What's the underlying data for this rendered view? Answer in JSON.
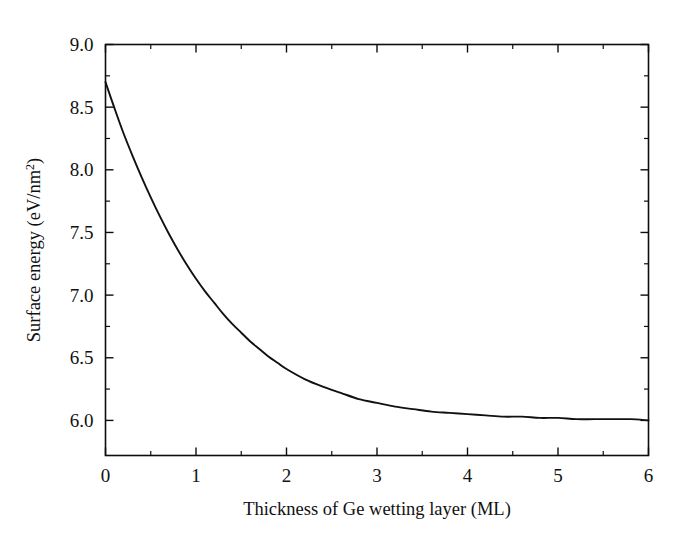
{
  "figure": {
    "background_color": "#ffffff",
    "line_color": "#111111",
    "axis_color": "#0d0d0d"
  },
  "chart_data": {
    "type": "line",
    "title": "",
    "xlabel": "Thickness of Ge wetting layer (ML)",
    "ylabel": "Surface energy (eV/nm2)",
    "ylabel_prefix": "Surface energy (eV/nm",
    "ylabel_superscript": "2",
    "ylabel_suffix": ")",
    "xlim": [
      0,
      6
    ],
    "ylim": [
      5.72,
      9.0
    ],
    "grid": false,
    "legend": "none",
    "x_major_ticks": [
      0,
      1,
      2,
      3,
      4,
      5,
      6
    ],
    "x_major_tick_labels": [
      "0",
      "1",
      "2",
      "3",
      "4",
      "5",
      "6"
    ],
    "x_minor_ticks": [
      0.5,
      1.5,
      2.5,
      3.5,
      4.5,
      5.5
    ],
    "y_major_ticks": [
      6.0,
      6.5,
      7.0,
      7.5,
      8.0,
      8.5,
      9.0
    ],
    "y_major_tick_labels": [
      "6.0",
      "6.5",
      "7.0",
      "7.5",
      "8.0",
      "8.5",
      "9.0"
    ],
    "y_minor_ticks": [
      6.25,
      6.75,
      7.25,
      7.75,
      8.25,
      8.75
    ],
    "series": [
      {
        "name": "surface energy",
        "x": [
          0.0,
          0.1,
          0.2,
          0.3,
          0.4,
          0.5,
          0.6,
          0.7,
          0.8,
          0.9,
          1.0,
          1.1,
          1.2,
          1.3,
          1.4,
          1.5,
          1.6,
          1.7,
          1.8,
          1.9,
          2.0,
          2.2,
          2.4,
          2.6,
          2.8,
          3.0,
          3.2,
          3.4,
          3.6,
          3.8,
          4.0,
          4.2,
          4.4,
          4.6,
          4.8,
          5.0,
          5.2,
          5.4,
          5.6,
          5.8,
          6.0
        ],
        "y": [
          8.7,
          8.49,
          8.29,
          8.11,
          7.94,
          7.78,
          7.63,
          7.49,
          7.36,
          7.24,
          7.13,
          7.03,
          6.94,
          6.85,
          6.77,
          6.7,
          6.63,
          6.57,
          6.51,
          6.46,
          6.41,
          6.33,
          6.27,
          6.22,
          6.17,
          6.14,
          6.11,
          6.09,
          6.07,
          6.06,
          6.05,
          6.04,
          6.03,
          6.03,
          6.02,
          6.02,
          6.01,
          6.01,
          6.01,
          6.01,
          6.0
        ]
      }
    ],
    "annotations": []
  }
}
